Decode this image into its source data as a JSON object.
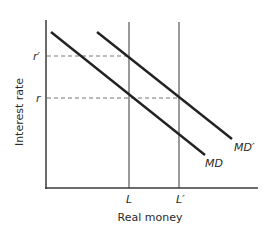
{
  "diagram": {
    "type": "money-demand-shift",
    "axes": {
      "x_label": "Real money",
      "y_label": "Interest rate"
    },
    "x_ticks": [
      {
        "label": "L"
      },
      {
        "label": "L′"
      }
    ],
    "y_ticks": [
      {
        "label": "r′"
      },
      {
        "label": "r"
      }
    ],
    "curves": [
      {
        "name": "MD",
        "label": "MD"
      },
      {
        "name": "MD-prime",
        "label": "MD′"
      }
    ],
    "colors": {
      "axis": "#3a3a3a",
      "curve": "#222222",
      "vertical_supply": "#9a9a9a",
      "dashed_guide": "#777777"
    }
  }
}
